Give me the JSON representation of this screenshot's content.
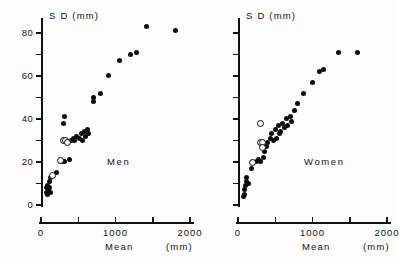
{
  "figure": {
    "panels": [
      {
        "key": "men",
        "label": "Men",
        "y_axis_title": "S D  (mm)",
        "x_axis_title": "Mean",
        "x_unit_label": "(mm)",
        "show_y_tick_labels": true
      },
      {
        "key": "women",
        "label": "Women",
        "y_axis_title": "S D  (mm)",
        "x_axis_title": "Mean",
        "x_unit_label": "(mm)",
        "show_y_tick_labels": false
      }
    ]
  },
  "chart_data": {
    "type": "scatter",
    "title": "",
    "xlabel": "Mean",
    "ylabel": "SD",
    "x_unit": "mm",
    "y_unit": "mm",
    "xlim": [
      0,
      2000
    ],
    "ylim": [
      0,
      85
    ],
    "x_ticks": [
      0,
      500,
      1000,
      1500,
      2000
    ],
    "x_tick_labels": [
      "0",
      "",
      "1000",
      "",
      "2000"
    ],
    "y_ticks": [
      0,
      10,
      20,
      30,
      40,
      50,
      60,
      70,
      80
    ],
    "y_tick_labels": [
      "0",
      "",
      "20",
      "",
      "40",
      "",
      "60",
      "",
      "80"
    ],
    "grid": false,
    "legend": false,
    "marker_types": {
      "filled": "closed circle",
      "open": "open circle"
    },
    "panels": [
      {
        "name": "Men",
        "series": [
          {
            "name": "filled",
            "marker": "filled",
            "points": [
              [
                75,
                6
              ],
              [
                80,
                8
              ],
              [
                85,
                5
              ],
              [
                90,
                9
              ],
              [
                95,
                7
              ],
              [
                115,
                11
              ],
              [
                120,
                8
              ],
              [
                125,
                13
              ],
              [
                130,
                6
              ],
              [
                205,
                15
              ],
              [
                265,
                20
              ],
              [
                300,
                20
              ],
              [
                320,
                20
              ],
              [
                380,
                21
              ],
              [
                415,
                30
              ],
              [
                440,
                31
              ],
              [
                455,
                30
              ],
              [
                470,
                32
              ],
              [
                300,
                38
              ],
              [
                310,
                41
              ],
              [
                520,
                31
              ],
              [
                545,
                33
              ],
              [
                560,
                30
              ],
              [
                580,
                34
              ],
              [
                600,
                32
              ],
              [
                620,
                35
              ],
              [
                640,
                33
              ],
              [
                700,
                48
              ],
              [
                710,
                50
              ],
              [
                800,
                52
              ],
              [
                900,
                60
              ],
              [
                1050,
                67
              ],
              [
                1200,
                70
              ],
              [
                1280,
                71
              ],
              [
                1420,
                83
              ],
              [
                1800,
                81
              ]
            ]
          },
          {
            "name": "open",
            "marker": "open",
            "points": [
              [
                155,
                14
              ],
              [
                250,
                21
              ],
              [
                290,
                30
              ],
              [
                320,
                30
              ],
              [
                350,
                29
              ]
            ]
          }
        ]
      },
      {
        "name": "Women",
        "series": [
          {
            "name": "filled",
            "marker": "filled",
            "points": [
              [
                80,
                4
              ],
              [
                85,
                7
              ],
              [
                90,
                5
              ],
              [
                95,
                9
              ],
              [
                110,
                11
              ],
              [
                120,
                13
              ],
              [
                135,
                10
              ],
              [
                180,
                17
              ],
              [
                250,
                20
              ],
              [
                270,
                21
              ],
              [
                300,
                20
              ],
              [
                340,
                22
              ],
              [
                360,
                25
              ],
              [
                380,
                27
              ],
              [
                400,
                29
              ],
              [
                440,
                31
              ],
              [
                450,
                33
              ],
              [
                470,
                30
              ],
              [
                500,
                35
              ],
              [
                520,
                31
              ],
              [
                540,
                37
              ],
              [
                560,
                33
              ],
              [
                575,
                34
              ],
              [
                600,
                38
              ],
              [
                620,
                36
              ],
              [
                650,
                40
              ],
              [
                670,
                37
              ],
              [
                700,
                41
              ],
              [
                720,
                39
              ],
              [
                760,
                44
              ],
              [
                800,
                47
              ],
              [
                880,
                52
              ],
              [
                1000,
                57
              ],
              [
                1100,
                62
              ],
              [
                1150,
                63
              ],
              [
                1350,
                71
              ],
              [
                1600,
                71
              ]
            ]
          },
          {
            "name": "open",
            "marker": "open",
            "points": [
              [
                190,
                20
              ],
              [
                300,
                29
              ],
              [
                320,
                29
              ],
              [
                325,
                27
              ],
              [
                300,
                38
              ]
            ]
          }
        ]
      }
    ]
  }
}
